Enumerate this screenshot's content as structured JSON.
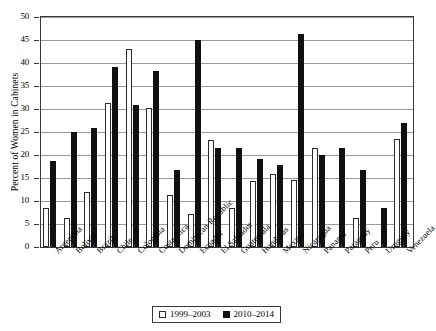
{
  "chart_data": {
    "type": "bar",
    "title": "",
    "xlabel": "",
    "ylabel": "Percent of Women in Cabinets",
    "ylim": [
      0,
      50
    ],
    "ytick_step": 5,
    "yticks": [
      0,
      5,
      10,
      15,
      20,
      25,
      30,
      35,
      40,
      45,
      50
    ],
    "grid": true,
    "legend_position": "bottom-center",
    "categories": [
      "Argentina",
      "Bolivia",
      "Brazil",
      "Chile",
      "Colombia",
      "Costa Rica",
      "Dominican Republic",
      "Ecuador",
      "El Salvador",
      "Guatemala",
      "Honduras",
      "Mexico",
      "Nicaragua",
      "Panama",
      "Paraguay",
      "Peru",
      "Uruguay",
      "Venezuela"
    ],
    "series": [
      {
        "name": "1999–2003",
        "fill": "#ffffff",
        "stroke": "#2b2b2b",
        "values": [
          8.4,
          6.3,
          12.0,
          31.3,
          43.0,
          30.2,
          11.2,
          7.1,
          23.2,
          8.4,
          14.4,
          15.9,
          14.5,
          21.6,
          null,
          6.4,
          null,
          23.4
        ]
      },
      {
        "name": "2010–2014",
        "fill": "#111111",
        "stroke": "#111111",
        "values": [
          18.7,
          25.0,
          25.8,
          39.2,
          30.8,
          38.2,
          16.8,
          44.9,
          21.5,
          21.5,
          19.1,
          17.8,
          46.3,
          20.1,
          21.5,
          16.8,
          8.4,
          26.9
        ]
      }
    ]
  },
  "legend": {
    "items": [
      {
        "label": "1999–2003",
        "style": "old"
      },
      {
        "label": "2010–2014",
        "style": "new"
      }
    ]
  }
}
